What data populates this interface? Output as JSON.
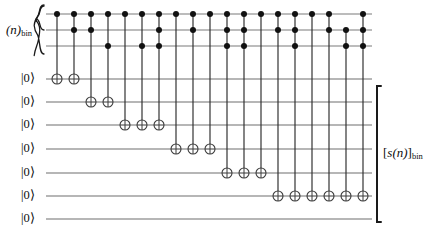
{
  "figure": {
    "type": "quantum-circuit-diagram",
    "width": 432,
    "height": 232,
    "background": "#ffffff",
    "ink_color": "#1a1a1a",
    "wire_color": "#6f6f6f"
  },
  "labels": {
    "input_register": {
      "main": "(n)",
      "subscript": "bin",
      "full": "(n)bin"
    },
    "output_register": {
      "open": "[",
      "main": "s(n)",
      "close": "]",
      "subscript": "bin",
      "full": "[s(n)]bin"
    },
    "ket_zero": "|0⟩"
  },
  "registers": {
    "input": {
      "name": "(n)bin",
      "wire_count": 3,
      "wire_labels": [
        "",
        "",
        ""
      ],
      "brace": "left-curly"
    },
    "ancilla": {
      "name": "[s(n)]bin",
      "wire_count": 6,
      "wire_labels": [
        "|0⟩",
        "|0⟩",
        "|0⟩",
        "|0⟩",
        "|0⟩",
        "|0⟩"
      ],
      "brace": "right-square"
    },
    "extra_zero_wires": [
      "|0⟩"
    ],
    "all_ket_labels": [
      "|0⟩",
      "|0⟩",
      "|0⟩",
      "|0⟩",
      "|0⟩",
      "|0⟩",
      "|0⟩"
    ]
  },
  "geometry": {
    "wire_x_start": 46,
    "wire_x_end": 372,
    "column_x_first": 57,
    "column_spacing": 17,
    "column_count": 19,
    "top_wire_y": [
      14,
      30,
      46
    ],
    "ancilla_wire_y": [
      79,
      102,
      125,
      149,
      173,
      196,
      219
    ],
    "dot_radius": 3.0,
    "target_radius": 5.0,
    "left_brace_x": 40,
    "right_brace_x": 377
  },
  "chart_data": {
    "type": "diagram",
    "title": "",
    "columns": 19,
    "control_wires": [
      "n0",
      "n1",
      "n2"
    ],
    "target_wires": [
      "a0",
      "a1",
      "a2",
      "a3",
      "a4",
      "a5",
      "a6"
    ],
    "gates": [
      {
        "column": 1,
        "controls": [
          0
        ],
        "target": 0
      },
      {
        "column": 2,
        "controls": [
          0,
          1
        ],
        "target": 0
      },
      {
        "column": 3,
        "controls": [
          0,
          1
        ],
        "target": 1
      },
      {
        "column": 4,
        "controls": [
          0,
          2
        ],
        "target": 1
      },
      {
        "column": 5,
        "controls": [
          0
        ],
        "target": 2
      },
      {
        "column": 6,
        "controls": [
          0,
          2
        ],
        "target": 2
      },
      {
        "column": 7,
        "controls": [
          0,
          1,
          2
        ],
        "target": 2
      },
      {
        "column": 8,
        "controls": [
          0
        ],
        "target": 3
      },
      {
        "column": 9,
        "controls": [
          0,
          1
        ],
        "target": 3
      },
      {
        "column": 10,
        "controls": [
          0
        ],
        "target": 3
      },
      {
        "column": 11,
        "controls": [
          0,
          1,
          2
        ],
        "target": 4
      },
      {
        "column": 12,
        "controls": [
          0,
          1,
          2
        ],
        "target": 4
      },
      {
        "column": 13,
        "controls": [
          0
        ],
        "target": 4
      },
      {
        "column": 14,
        "controls": [
          0,
          1
        ],
        "target": 5
      },
      {
        "column": 15,
        "controls": [
          0,
          1,
          2
        ],
        "target": 5
      },
      {
        "column": 16,
        "controls": [
          0
        ],
        "target": 5
      },
      {
        "column": 17,
        "controls": [
          0,
          1
        ],
        "target": 5
      },
      {
        "column": 18,
        "controls": [
          1,
          2
        ],
        "target": 5
      },
      {
        "column": 19,
        "controls": [
          0,
          1,
          2
        ],
        "target": 5
      }
    ]
  }
}
